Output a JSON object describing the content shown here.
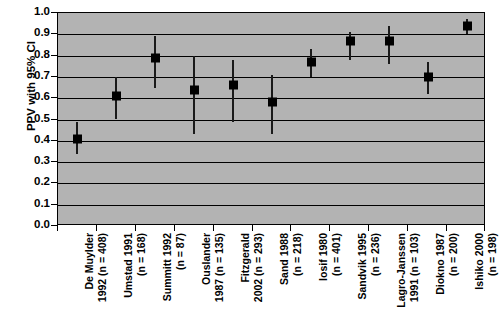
{
  "chart_data": {
    "type": "scatter",
    "title": "",
    "subtitle": "",
    "xlabel": "",
    "ylabel": "PPV with 95% CI",
    "ylim": [
      0.0,
      1.0
    ],
    "grid": true,
    "legend": false,
    "plot_background_color": "#b3b3b3",
    "marker_color": "#000000",
    "errorbar_color": "#1a1a1a",
    "y_ticks": [
      "1.0",
      "0.9",
      "0.8",
      "0.7",
      "0.6",
      "0.5",
      "0.4",
      "0.3",
      "0.2",
      "0.1",
      "0.0"
    ],
    "y_tick_values": [
      1.0,
      0.9,
      0.8,
      0.7,
      0.6,
      0.5,
      0.4,
      0.3,
      0.2,
      0.1,
      0.0
    ],
    "categories": [
      "De Muylder\n1992 (n = 408)",
      "Umstad 1991\n(n = 168)",
      "Summitt 1992\n(n = 87)",
      "Ouslander\n1987 (n = 135)",
      "Fitzgerald\n2002 (n = 293)",
      "Sand 1988\n(n = 218)",
      "Iosif 1980\n(n = 401)",
      "Sandvik 1995\n(n = 236)",
      "Lagro-Janssen\n1991 (n = 103)",
      "Diokno 1987\n(n = 200)",
      "Ishiko 2000\n(n = 198)"
    ],
    "values": [
      0.41,
      0.61,
      0.79,
      0.64,
      0.66,
      0.58,
      0.77,
      0.87,
      0.87,
      0.7,
      0.94
    ],
    "ci_lower": [
      0.34,
      0.5,
      0.65,
      0.43,
      0.49,
      0.43,
      0.7,
      0.78,
      0.76,
      0.62,
      0.9
    ],
    "ci_upper": [
      0.49,
      0.7,
      0.89,
      0.8,
      0.78,
      0.71,
      0.83,
      0.91,
      0.94,
      0.77,
      0.97
    ],
    "points": [
      {
        "label": "De Muylder 1992 (n = 408)",
        "study": "De Muylder",
        "year": 1992,
        "n": 408,
        "value": 0.41,
        "ci_lower": 0.34,
        "ci_upper": 0.49
      },
      {
        "label": "Umstad 1991 (n = 168)",
        "study": "Umstad",
        "year": 1991,
        "n": 168,
        "value": 0.61,
        "ci_lower": 0.5,
        "ci_upper": 0.7
      },
      {
        "label": "Summitt 1992 (n = 87)",
        "study": "Summitt",
        "year": 1992,
        "n": 87,
        "value": 0.79,
        "ci_lower": 0.65,
        "ci_upper": 0.89
      },
      {
        "label": "Ouslander 1987 (n = 135)",
        "study": "Ouslander",
        "year": 1987,
        "n": 135,
        "value": 0.64,
        "ci_lower": 0.43,
        "ci_upper": 0.8
      },
      {
        "label": "Fitzgerald 2002 (n = 293)",
        "study": "Fitzgerald",
        "year": 2002,
        "n": 293,
        "value": 0.66,
        "ci_lower": 0.49,
        "ci_upper": 0.78
      },
      {
        "label": "Sand 1988 (n = 218)",
        "study": "Sand",
        "year": 1988,
        "n": 218,
        "value": 0.58,
        "ci_lower": 0.43,
        "ci_upper": 0.71
      },
      {
        "label": "Iosif 1980 (n = 401)",
        "study": "Iosif",
        "year": 1980,
        "n": 401,
        "value": 0.77,
        "ci_lower": 0.7,
        "ci_upper": 0.83
      },
      {
        "label": "Sandvik 1995 (n = 236)",
        "study": "Sandvik",
        "year": 1995,
        "n": 236,
        "value": 0.87,
        "ci_lower": 0.78,
        "ci_upper": 0.91
      },
      {
        "label": "Lagro-Janssen 1991 (n = 103)",
        "study": "Lagro-Janssen",
        "year": 1991,
        "n": 103,
        "value": 0.87,
        "ci_lower": 0.76,
        "ci_upper": 0.94
      },
      {
        "label": "Diokno 1987 (n = 200)",
        "study": "Diokno",
        "year": 1987,
        "n": 200,
        "value": 0.7,
        "ci_lower": 0.62,
        "ci_upper": 0.77
      },
      {
        "label": "Ishiko 2000 (n = 198)",
        "study": "Ishiko",
        "year": 2000,
        "n": 198,
        "value": 0.94,
        "ci_lower": 0.9,
        "ci_upper": 0.97
      }
    ]
  }
}
